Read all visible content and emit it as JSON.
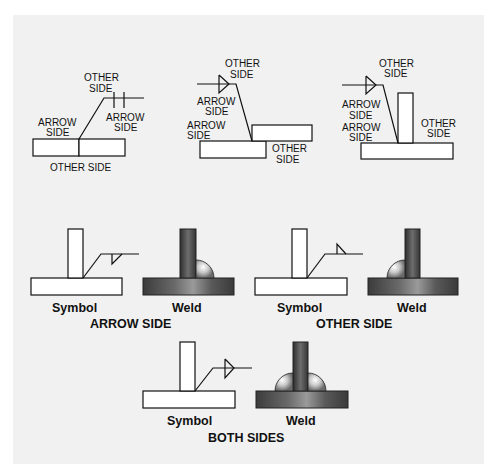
{
  "diagram": {
    "title_hidden": "",
    "top_row": [
      {
        "id": "butt-joint",
        "labels": {
          "other_side_top": [
            "OTHER",
            "SIDE"
          ],
          "arrow_side_right": [
            "ARROW",
            "SIDE"
          ],
          "arrow_side_left": [
            "ARROW",
            "SIDE"
          ],
          "other_side_bottom": "OTHER SIDE"
        }
      },
      {
        "id": "lap-joint",
        "labels": {
          "other_side_top": [
            "OTHER",
            "SIDE"
          ],
          "arrow_side_symbol": [
            "ARROW",
            "SIDE"
          ],
          "arrow_side_plate": [
            "ARROW",
            "SIDE"
          ],
          "other_side_plate": [
            "OTHER",
            "SIDE"
          ]
        }
      },
      {
        "id": "tee-joint",
        "labels": {
          "other_side_top": [
            "OTHER",
            "SIDE"
          ],
          "arrow_side_symbol": [
            "ARROW",
            "SIDE"
          ],
          "arrow_side_plate": [
            "ARROW",
            "SIDE"
          ],
          "other_side_plate": [
            "OTHER",
            "SIDE"
          ]
        }
      }
    ],
    "examples": [
      {
        "id": "arrow-side",
        "symbol_label": "Symbol",
        "weld_label": "Weld",
        "caption": "ARROW SIDE"
      },
      {
        "id": "other-side",
        "symbol_label": "Symbol",
        "weld_label": "Weld",
        "caption": "OTHER SIDE"
      },
      {
        "id": "both-sides",
        "symbol_label": "Symbol",
        "weld_label": "Weld",
        "caption": "BOTH SIDES"
      }
    ],
    "colors": {
      "panel_background": "#f1f1f1",
      "line": "#111111",
      "steel_dark": "#3a3a3a",
      "steel_light": "#8a8a8a",
      "bead_highlight": "#ffffff"
    }
  }
}
